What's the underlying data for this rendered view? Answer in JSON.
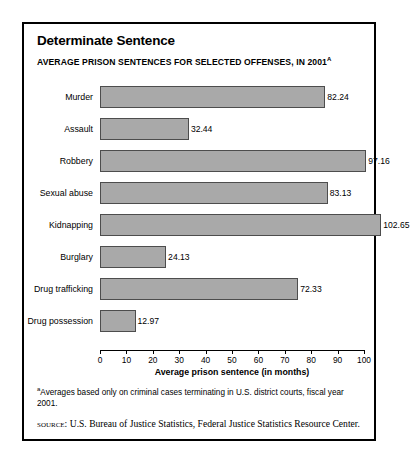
{
  "panel": {
    "title": "Determinate Sentence",
    "subtitle": "AVERAGE PRISON SENTENCES FOR SELECTED OFFENSES, IN 2001",
    "subtitle_superscript": "a",
    "footnote_superscript": "a",
    "footnote": "Averages based only on criminal cases terminating in U.S. district courts, fiscal year 2001.",
    "source_label": "SOURCE:",
    "source_text": "U.S. Bureau of Justice Statistics, Federal Justice Statistics Resource Center.",
    "colors": {
      "bar_fill": "#a9a9a9",
      "bar_stroke": "#4d4d4d",
      "frame": "#000000",
      "background": "#ffffff"
    }
  },
  "chart_data": {
    "type": "bar",
    "orientation": "horizontal",
    "title": "Determinate Sentence",
    "subtitle": "AVERAGE PRISON SENTENCES FOR SELECTED OFFENSES, IN 2001",
    "categories": [
      "Murder",
      "Assault",
      "Robbery",
      "Sexual abuse",
      "Kidnapping",
      "Burglary",
      "Drug trafficking",
      "Drug possession"
    ],
    "values": [
      82.24,
      32.44,
      97.16,
      83.13,
      102.65,
      24.13,
      72.33,
      12.97
    ],
    "value_labels": [
      "82.24",
      "32.44",
      "97.16",
      "83.13",
      "102.65",
      "24.13",
      "72.33",
      "12.97"
    ],
    "xlabel": "Average prison sentence (in months)",
    "ylabel": "",
    "xlim": [
      0,
      100
    ],
    "xticks": [
      0,
      10,
      20,
      30,
      40,
      50,
      60,
      70,
      80,
      90,
      100
    ],
    "xtick_labels": [
      "0",
      "10",
      "20",
      "30",
      "40",
      "50",
      "60",
      "70",
      "80",
      "90",
      "100"
    ],
    "grid": false,
    "legend": false,
    "units": "months"
  }
}
